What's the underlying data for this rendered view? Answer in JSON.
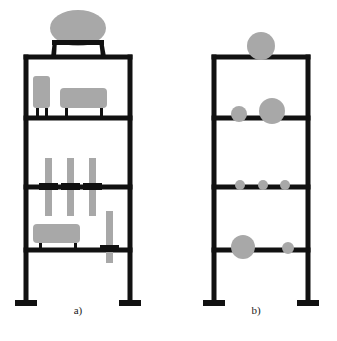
{
  "figure": {
    "background_color": "#ffffff",
    "frame_color": "#111111",
    "mass_color": "#a8a8a8",
    "panels": [
      {
        "id": "panel-a",
        "caption": "a)",
        "caption_x": 78,
        "caption_y": 314,
        "description": "Four-storey frame with physical equipment blocks, rods and a rooftop elliptical tank",
        "frame": {
          "left_column_x": 26,
          "right_column_x": 130,
          "column_thickness": 5,
          "beam_thickness": 5,
          "beam_levels_y": [
            57,
            118,
            187,
            250
          ],
          "base_y": 300,
          "foot_width": 22,
          "foot_height": 6
        },
        "roof_tank": {
          "ellipse_cx": 78,
          "ellipse_cy": 28,
          "ellipse_rx": 28,
          "ellipse_ry": 18,
          "plate_x": 52,
          "plate_y": 40,
          "plate_width": 52,
          "plate_height": 5,
          "leg_left_bottom_x": 56,
          "leg_right_bottom_x": 101,
          "leg_bottom_y": 57
        },
        "blocks": [
          {
            "name": "tall-block-level1",
            "x": 33,
            "y": 76,
            "width": 17,
            "height": 32,
            "rx": 3,
            "feet": [
              36,
              45
            ],
            "foot_top_y": 108,
            "foot_height": 10,
            "foot_width": 3
          },
          {
            "name": "wide-block-level1",
            "x": 60,
            "y": 88,
            "width": 47,
            "height": 20,
            "rx": 4,
            "feet": [
              65,
              100
            ],
            "foot_top_y": 108,
            "foot_height": 10,
            "foot_width": 3
          },
          {
            "name": "wide-block-level4",
            "x": 33,
            "y": 224,
            "width": 47,
            "height": 19,
            "rx": 4,
            "feet": [
              39,
              74
            ],
            "foot_top_y": 243,
            "foot_height": 7,
            "foot_width": 3
          }
        ],
        "rods": [
          {
            "name": "hanging-rod-1",
            "x": 45,
            "y": 158,
            "width": 7,
            "height": 58,
            "anchor_x": 39,
            "anchor_y": 183,
            "anchor_width": 19,
            "anchor_height": 7
          },
          {
            "name": "hanging-rod-2",
            "x": 67,
            "y": 158,
            "width": 7,
            "height": 58,
            "anchor_x": 61,
            "anchor_y": 183,
            "anchor_width": 19,
            "anchor_height": 7
          },
          {
            "name": "hanging-rod-3",
            "x": 89,
            "y": 158,
            "width": 7,
            "height": 58,
            "anchor_x": 83,
            "anchor_y": 183,
            "anchor_width": 19,
            "anchor_height": 7
          },
          {
            "name": "hanging-rod-4",
            "x": 106,
            "y": 211,
            "width": 7,
            "height": 52,
            "anchor_x": 100,
            "anchor_y": 245,
            "anchor_width": 19,
            "anchor_height": 7
          }
        ]
      },
      {
        "id": "panel-b",
        "caption": "b)",
        "caption_x": 256,
        "caption_y": 314,
        "description": "Equivalent lumped-mass idealised frame model with circular mass markers",
        "frame": {
          "left_column_x": 214,
          "right_column_x": 308,
          "column_thickness": 5,
          "beam_thickness": 5,
          "beam_levels_y": [
            57,
            118,
            187,
            250
          ],
          "base_y": 300,
          "foot_width": 22,
          "foot_height": 6
        },
        "masses": [
          {
            "name": "mass-level1-center",
            "cx": 261,
            "cy": 46,
            "r": 14,
            "level": 1
          },
          {
            "name": "mass-level2-left",
            "cx": 239,
            "cy": 114,
            "r": 8,
            "level": 2
          },
          {
            "name": "mass-level2-center",
            "cx": 272,
            "cy": 111,
            "r": 13,
            "level": 2
          },
          {
            "name": "mass-level3-left",
            "cx": 240,
            "cy": 185,
            "r": 5,
            "level": 3
          },
          {
            "name": "mass-level3-center",
            "cx": 263,
            "cy": 185,
            "r": 5,
            "level": 3
          },
          {
            "name": "mass-level3-right",
            "cx": 285,
            "cy": 185,
            "r": 5,
            "level": 3
          },
          {
            "name": "mass-level4-left",
            "cx": 243,
            "cy": 247,
            "r": 12,
            "level": 4
          },
          {
            "name": "mass-level4-right",
            "cx": 288,
            "cy": 248,
            "r": 6,
            "level": 4
          }
        ]
      }
    ]
  }
}
